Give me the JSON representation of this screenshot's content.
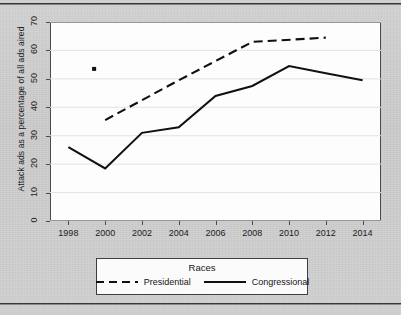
{
  "chart_data": {
    "type": "line",
    "title": "",
    "xlabel": "",
    "ylabel": "Attack ads as a percentage of all ads aired",
    "xlim": [
      1997,
      2015
    ],
    "ylim": [
      0,
      70
    ],
    "grid": true,
    "x_ticks": [
      "1998",
      "2000",
      "2002",
      "2004",
      "2006",
      "2008",
      "2010",
      "2012",
      "2014"
    ],
    "y_ticks": [
      "0",
      "10",
      "20",
      "30",
      "40",
      "50",
      "60",
      "70"
    ],
    "legend": {
      "title": "Races",
      "position": "below-plot",
      "entries": [
        {
          "name": "Presidential",
          "style": "dashed"
        },
        {
          "name": "Congressional",
          "style": "solid"
        }
      ]
    },
    "series": [
      {
        "name": "Presidential",
        "style": "dashed",
        "color": "#101010",
        "x": [
          2000,
          2004,
          2008,
          2012
        ],
        "values": [
          35.5,
          49.5,
          63.0,
          64.5
        ]
      },
      {
        "name": "Congressional",
        "style": "solid",
        "color": "#101010",
        "x": [
          1998,
          2000,
          2002,
          2004,
          2006,
          2008,
          2010,
          2012,
          2014
        ],
        "values": [
          26.0,
          18.5,
          31.0,
          33.0,
          44.0,
          47.5,
          54.5,
          52.0,
          49.5
        ]
      }
    ],
    "markers": [
      {
        "name": "presidential-1999-point",
        "x": 1999.4,
        "y": 53.5,
        "shape": "square-dot"
      }
    ]
  },
  "page": {
    "rule_top": "horizontal-rule",
    "rule_bottom": "horizontal-rule"
  }
}
